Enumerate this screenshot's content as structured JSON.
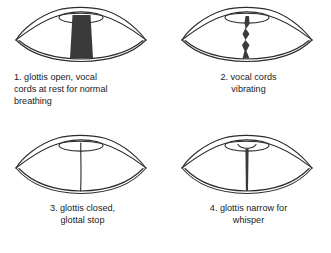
{
  "figure": {
    "background_color": "#ffffff",
    "outline_color": "#2b2b2b",
    "fill_color": "#3a3a3a",
    "text_color": "#1a1a1a"
  },
  "panels": [
    {
      "number": "1.",
      "caption": "1. glottis open, vocal\ncords at rest for normal\nbreathing",
      "icon_name": "glottis-open-icon",
      "state": "glottis open",
      "align": "left"
    },
    {
      "number": "2.",
      "caption": "2. vocal cords\nvibrating",
      "icon_name": "vocal-cords-vibrating-icon",
      "state": "vocal cords vibrating",
      "align": "center"
    },
    {
      "number": "3.",
      "caption": "3. glottis closed,\nglottal stop",
      "icon_name": "glottis-closed-icon",
      "state": "glottis closed",
      "align": "center"
    },
    {
      "number": "4.",
      "caption": "4. glottis narrow for\nwhisper",
      "icon_name": "glottis-narrow-icon",
      "state": "glottis narrow",
      "align": "center"
    }
  ]
}
